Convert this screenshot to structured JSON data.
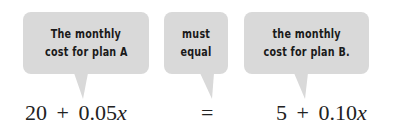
{
  "bubbles": [
    {
      "lines": [
        "The monthly",
        "cost for plan A"
      ]
    },
    {
      "lines": [
        "must",
        "equal"
      ]
    },
    {
      "lines": [
        "the monthly",
        "cost for plan B."
      ]
    }
  ],
  "equation": {
    "left": {
      "constant": "20",
      "op": "+",
      "coef": "0.05",
      "var": "x"
    },
    "relation": "=",
    "right": {
      "constant": "5",
      "op": "+",
      "coef": "0.10",
      "var": "x"
    }
  },
  "colors": {
    "bubble": "#d9d9d9",
    "text": "#1a1a1a",
    "background": "#ffffff"
  }
}
